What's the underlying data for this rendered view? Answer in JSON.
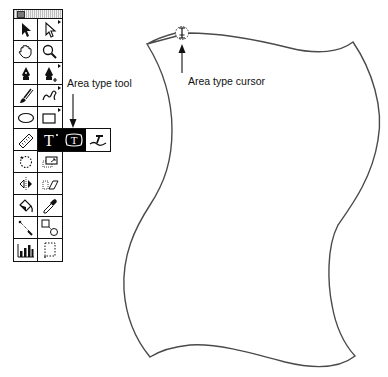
{
  "annotations": {
    "area_type_tool_label": "Area type tool",
    "area_type_cursor_label": "Area type cursor"
  },
  "toolbox": {
    "title_bar": "",
    "tools": [
      {
        "name": "selection-tool",
        "icon": "arrow-icon",
        "has_flyout": false
      },
      {
        "name": "direct-selection-tool",
        "icon": "hollow-arrow-icon",
        "has_flyout": true
      },
      {
        "name": "hand-tool",
        "icon": "hand-icon",
        "has_flyout": false
      },
      {
        "name": "zoom-tool",
        "icon": "magnifier-icon",
        "has_flyout": false
      },
      {
        "name": "pen-tool",
        "icon": "pen-nib-icon",
        "has_flyout": false
      },
      {
        "name": "add-anchor-tool",
        "icon": "pen-plus-icon",
        "has_flyout": true
      },
      {
        "name": "brush-tool",
        "icon": "brush-icon",
        "has_flyout": false
      },
      {
        "name": "freehand-tool",
        "icon": "squiggle-icon",
        "has_flyout": true
      },
      {
        "name": "oval-tool",
        "icon": "ellipse-icon",
        "has_flyout": false
      },
      {
        "name": "rectangle-tool",
        "icon": "rectangle-icon",
        "has_flyout": true
      },
      {
        "name": "measure-tool",
        "icon": "ruler-icon",
        "has_flyout": false
      },
      {
        "name": "type-tool",
        "icon": "type-icon",
        "has_flyout": true,
        "selected": true
      },
      {
        "name": "rotate-tool",
        "icon": "rotate-icon",
        "has_flyout": false
      },
      {
        "name": "scale-tool",
        "icon": "scale-icon",
        "has_flyout": false
      },
      {
        "name": "reflect-tool",
        "icon": "reflect-icon",
        "has_flyout": false
      },
      {
        "name": "shear-tool",
        "icon": "shear-icon",
        "has_flyout": false
      },
      {
        "name": "paint-bucket-tool",
        "icon": "paint-bucket-icon",
        "has_flyout": false
      },
      {
        "name": "eyedropper-tool",
        "icon": "eyedropper-icon",
        "has_flyout": false
      },
      {
        "name": "blend-tool",
        "icon": "blend-icon",
        "has_flyout": false
      },
      {
        "name": "auto-trace-tool",
        "icon": "auto-trace-icon",
        "has_flyout": false
      },
      {
        "name": "graph-tool",
        "icon": "bar-graph-icon",
        "has_flyout": false
      },
      {
        "name": "page-tool",
        "icon": "page-icon",
        "has_flyout": false
      }
    ],
    "type_flyout": [
      {
        "name": "type-tool",
        "glyph": "T",
        "selected": true
      },
      {
        "name": "area-type-tool",
        "glyph": "T",
        "selected": true
      },
      {
        "name": "path-type-tool",
        "glyph": "",
        "selected": false
      }
    ]
  },
  "canvas": {
    "shape": "wavy-rectangle-path",
    "cursor": "area-type-cursor"
  },
  "colors": {
    "stroke": "#4a4a4a",
    "ink": "#111111",
    "selected_bg": "#000000"
  }
}
